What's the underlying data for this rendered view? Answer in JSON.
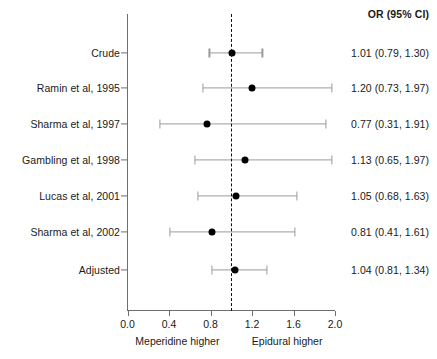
{
  "chart_data": {
    "type": "forest",
    "title": "",
    "xlabel": "",
    "ylabel": "",
    "xlim": [
      0.0,
      2.0
    ],
    "xticks": [
      0.0,
      0.4,
      0.8,
      1.2,
      1.6,
      2.0
    ],
    "xtick_labels": [
      "0.0",
      "0.4",
      "0.8",
      "1.2",
      "1.6",
      "2.0"
    ],
    "grid": false,
    "reference_line": 1.0,
    "effect_measure": "OR",
    "column_header": "OR (95% CI)",
    "left_caption": "Meperidine higher",
    "right_caption": "Epidural higher",
    "rows": [
      {
        "label": "Crude",
        "or": 1.01,
        "lcl": 0.79,
        "ucl": 1.3,
        "text": "1.01 (0.79, 1.30)"
      },
      {
        "label": "Ramin et al, 1995",
        "or": 1.2,
        "lcl": 0.73,
        "ucl": 1.97,
        "text": "1.20 (0.73, 1.97)"
      },
      {
        "label": "Sharma et al, 1997",
        "or": 0.77,
        "lcl": 0.31,
        "ucl": 1.91,
        "text": "0.77 (0.31, 1.91)"
      },
      {
        "label": "Gambling et al, 1998",
        "or": 1.13,
        "lcl": 0.65,
        "ucl": 1.97,
        "text": "1.13 (0.65, 1.97)"
      },
      {
        "label": "Lucas et al, 2001",
        "or": 1.05,
        "lcl": 0.68,
        "ucl": 1.63,
        "text": "1.05 (0.68, 1.63)"
      },
      {
        "label": "Sharma et al, 2002",
        "or": 0.81,
        "lcl": 0.41,
        "ucl": 1.61,
        "text": "0.81 (0.41, 1.61)"
      },
      {
        "label": "Adjusted",
        "or": 1.04,
        "lcl": 0.81,
        "ucl": 1.34,
        "text": "1.04 (0.81, 1.34)"
      }
    ],
    "colors": {
      "point": "#000000",
      "ci": "#9a9a9a",
      "axis": "#6e6e6e",
      "reference": "#111111",
      "text": "#1a1a1a",
      "background": "#ffffff"
    }
  }
}
